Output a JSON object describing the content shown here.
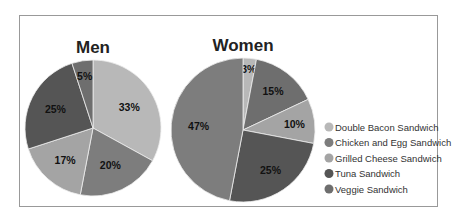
{
  "chart_data": [
    {
      "type": "pie",
      "title": "Men",
      "categories": [
        "Double Bacon Sandwich",
        "Chicken and Egg Sandwich",
        "Grilled Cheese Sandwich",
        "Tuna Sandwich",
        "Veggie Sandwich"
      ],
      "values": [
        33,
        20,
        17,
        25,
        5
      ],
      "labels": [
        "33%",
        "20%",
        "17%",
        "25%",
        "5%"
      ]
    },
    {
      "type": "pie",
      "title": "Women",
      "categories": [
        "Double Bacon Sandwich",
        "Veggie Sandwich",
        "Grilled Cheese Sandwich",
        "Tuna Sandwich",
        "Chicken and Egg Sandwich"
      ],
      "values": [
        3,
        15,
        10,
        25,
        47
      ],
      "labels": [
        "3%",
        "15%",
        "10%",
        "25%",
        "47%"
      ]
    }
  ],
  "legend": {
    "position": "right",
    "items": [
      {
        "label": "Double Bacon Sandwich",
        "color": "#b8b8b8"
      },
      {
        "label": "Chicken and Egg Sandwich",
        "color": "#7d7d7d"
      },
      {
        "label": "Grilled Cheese Sandwich",
        "color": "#a4a4a4"
      },
      {
        "label": "Tuna Sandwich",
        "color": "#555555"
      },
      {
        "label": "Veggie Sandwich",
        "color": "#6e6e6e"
      }
    ]
  }
}
